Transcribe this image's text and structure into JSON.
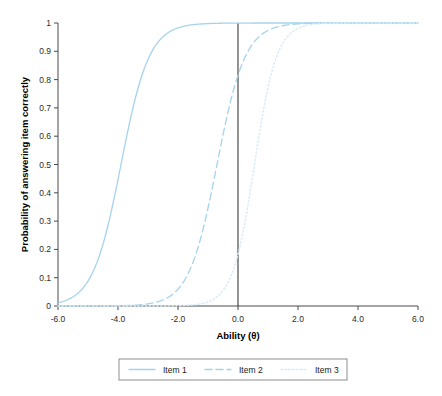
{
  "chart_data": {
    "type": "line",
    "title": "",
    "subtitle": "",
    "xlabel": "Ability (θ)",
    "ylabel": "Probability of answering item correctly",
    "xlim": [
      -6.0,
      6.0
    ],
    "ylim": [
      0,
      1
    ],
    "xticks": [
      "-6.0",
      "-4.0",
      "-2.0",
      "0.0",
      "2.0",
      "4.0",
      "6.0"
    ],
    "xtick_values": [
      -6.0,
      -4.0,
      -2.0,
      0.0,
      2.0,
      4.0,
      6.0
    ],
    "yticks": [
      "0",
      "0.1",
      "0.2",
      "0.3",
      "0.4",
      "0.5",
      "0.6",
      "0.7",
      "0.8",
      "0.9",
      "1"
    ],
    "ytick_values": [
      0,
      0.1,
      0.2,
      0.3,
      0.4,
      0.5,
      0.6,
      0.7,
      0.8,
      0.9,
      1.0
    ],
    "grid": false,
    "legend_position": "bottom",
    "annotations": [
      {
        "name": "theta-zero-reference-line",
        "type": "vline",
        "x": 0.0,
        "color": "#3a3a3a"
      }
    ],
    "series": [
      {
        "name": "Item 1",
        "style": "solid",
        "color": "#a5d3ec",
        "difficulty_b": -3.9,
        "discrimination_a": 1.25,
        "guessing_c": 0.0,
        "x": [
          -6.0,
          -5.5,
          -5.0,
          -4.5,
          -4.0,
          -3.5,
          -3.0,
          -2.5,
          -2.0,
          -1.5,
          -1.0,
          -0.5,
          0.0,
          1.0,
          2.0,
          3.0,
          4.0,
          5.0,
          6.0
        ],
        "values": [
          0.04,
          0.07,
          0.13,
          0.22,
          0.36,
          0.52,
          0.68,
          0.81,
          0.9,
          0.95,
          0.97,
          0.99,
          0.99,
          1.0,
          1.0,
          1.0,
          1.0,
          1.0,
          1.0
        ]
      },
      {
        "name": "Item 2",
        "style": "dashed",
        "color": "#a5d3ec",
        "difficulty_b": -0.7,
        "discrimination_a": 1.25,
        "guessing_c": 0.0,
        "x": [
          -6.0,
          -5.0,
          -4.5,
          -4.0,
          -3.5,
          -3.0,
          -2.5,
          -2.0,
          -1.5,
          -1.0,
          -0.5,
          0.0,
          0.5,
          1.0,
          1.5,
          2.0,
          3.0,
          4.0,
          5.0,
          6.0
        ],
        "values": [
          0.001,
          0.005,
          0.009,
          0.02,
          0.03,
          0.06,
          0.1,
          0.17,
          0.27,
          0.41,
          0.56,
          0.85,
          0.88,
          0.93,
          0.96,
          0.98,
          0.99,
          1.0,
          1.0,
          1.0
        ]
      },
      {
        "name": "Item 3",
        "style": "dotted",
        "color": "#d7ecf8",
        "difficulty_b": 0.55,
        "discrimination_a": 1.6,
        "guessing_c": 0.0,
        "x": [
          -6.0,
          -5.0,
          -4.0,
          -3.0,
          -2.5,
          -2.0,
          -1.5,
          -1.0,
          -0.5,
          0.0,
          0.5,
          1.0,
          1.5,
          2.0,
          2.5,
          3.0,
          4.0,
          5.0,
          6.0
        ],
        "values": [
          0.0,
          0.0,
          0.001,
          0.004,
          0.01,
          0.02,
          0.05,
          0.1,
          0.19,
          0.3,
          0.52,
          0.7,
          0.84,
          0.92,
          0.96,
          0.98,
          1.0,
          1.0,
          1.0
        ]
      }
    ],
    "legend": [
      {
        "label": "Item 1",
        "style": "solid",
        "color": "#a5d3ec"
      },
      {
        "label": "Item 2",
        "style": "dashed",
        "color": "#a5d3ec"
      },
      {
        "label": "Item 3",
        "style": "dotted",
        "color": "#d7ecf8"
      }
    ]
  }
}
